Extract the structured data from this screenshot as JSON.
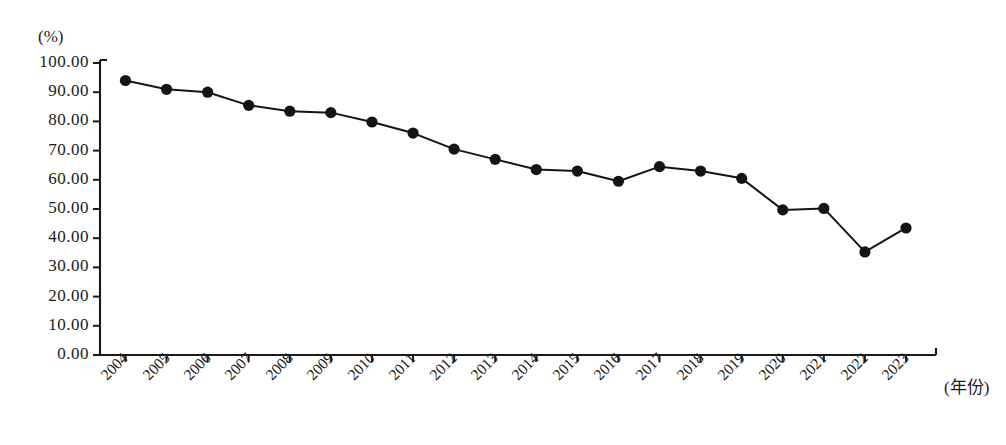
{
  "chart_data": {
    "type": "line",
    "title": "",
    "subtitle": "",
    "xlabel": "(年份)",
    "ylabel": "(%)",
    "ylim": [
      0,
      100
    ],
    "grid": false,
    "legend": "none",
    "marker": "filled-circle",
    "line_color": "#141414",
    "marker_color": "#141414",
    "background_color": "#ffffff",
    "categories": [
      "2004",
      "2005",
      "2006",
      "2007",
      "2008",
      "2009",
      "2010",
      "2011",
      "2012",
      "2013",
      "2014",
      "2015",
      "2016",
      "2017",
      "2018",
      "2019",
      "2020",
      "2021",
      "2022",
      "2023"
    ],
    "values": [
      94.0,
      91.0,
      90.0,
      85.5,
      83.5,
      83.0,
      79.8,
      76.0,
      70.5,
      67.0,
      63.5,
      63.0,
      59.5,
      64.5,
      63.0,
      60.5,
      49.7,
      50.2,
      35.3,
      43.5
    ],
    "ytick_labels": [
      "100.00",
      "90.00",
      "80.00",
      "70.00",
      "60.00",
      "50.00",
      "40.00",
      "30.00",
      "20.00",
      "10.00",
      "0.00"
    ],
    "ytick_values": [
      100,
      90,
      80,
      70,
      60,
      50,
      40,
      30,
      20,
      10,
      0
    ],
    "xtick_labels": [
      "2004",
      "2005",
      "2006",
      "2007",
      "2008",
      "2009",
      "2010",
      "2011",
      "2012",
      "2013",
      "2014",
      "2015",
      "2016",
      "2017",
      "2018",
      "2019",
      "2020",
      "2021",
      "2022",
      "2023"
    ]
  }
}
